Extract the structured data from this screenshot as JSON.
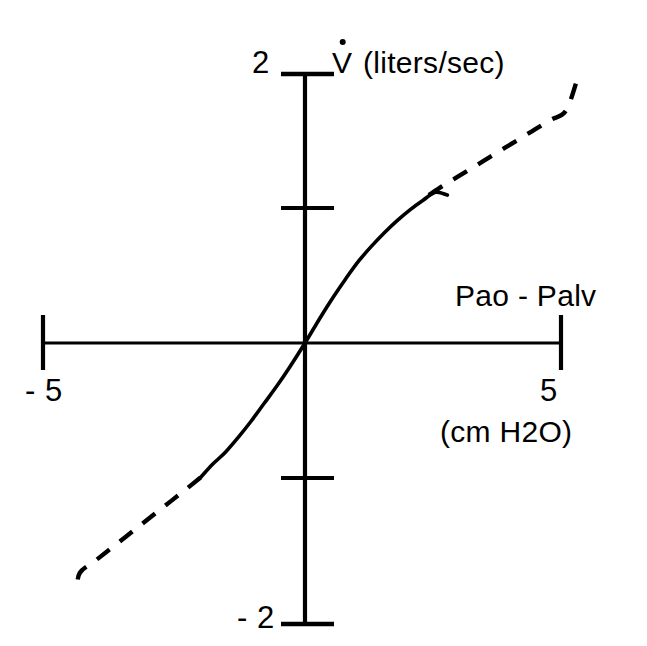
{
  "figure": {
    "background_color": "#ffffff",
    "ink_color": "#000000"
  },
  "axes": {
    "y_axis": {
      "title_symbol": "V",
      "title_units": " (liters/sec)",
      "tick_label_top": "2",
      "tick_label_bottom": "- 2"
    },
    "x_axis": {
      "title": "Pao - Palv",
      "units": "(cm H2O)",
      "tick_label_left": "- 5",
      "tick_label_right": "5"
    }
  },
  "chart_data": {
    "type": "line",
    "title": "",
    "subtitle": "",
    "xlabel": "Pao - Palv (cm H2O)",
    "ylabel": "V̇ (liters/sec)",
    "xlim": [
      -5,
      5
    ],
    "ylim": [
      -2,
      2
    ],
    "xticks": [
      -5,
      0,
      5
    ],
    "xtick_labels": [
      "- 5",
      "",
      "5"
    ],
    "yticks": [
      -2,
      -1,
      0,
      1,
      2
    ],
    "ytick_labels": [
      "- 2",
      "",
      "",
      "",
      "2"
    ],
    "grid": false,
    "legend": null,
    "annotations": [
      {
        "text": "Pao - Palv",
        "x": 3.0,
        "y": 0.46
      },
      {
        "text": "(cm H2O)",
        "x": 2.7,
        "y": -0.55
      },
      {
        "text": "V̇ (liters/sec)",
        "x": 0.55,
        "y": 2.1
      }
    ],
    "series": [
      {
        "name": "airway-flow-vs-pressure",
        "style": "solid",
        "comment": "measured range, drawn as a continuous line",
        "x": [
          -2.04,
          -1.8,
          -1.55,
          -1.3,
          -1.05,
          -0.8,
          -0.55,
          -0.3,
          0.0,
          0.3,
          0.55,
          0.8,
          1.05,
          1.3,
          1.55,
          1.8,
          2.05,
          2.3,
          2.55,
          2.78
        ],
        "y": [
          -1.0,
          -0.9,
          -0.81,
          -0.7,
          -0.58,
          -0.45,
          -0.32,
          -0.18,
          0.0,
          0.19,
          0.34,
          0.48,
          0.61,
          0.72,
          0.82,
          0.91,
          0.99,
          1.06,
          1.12,
          1.1
        ]
      },
      {
        "name": "airway-flow-vs-pressure-extrapolated-upper",
        "style": "dashed",
        "comment": "extrapolated upper-right branch",
        "x": [
          2.42,
          2.7,
          3.0,
          3.3,
          3.6,
          3.9,
          4.2,
          4.5,
          4.8,
          5.1,
          5.34
        ],
        "y": [
          1.1,
          1.17,
          1.24,
          1.31,
          1.38,
          1.45,
          1.52,
          1.59,
          1.66,
          1.73,
          1.99
        ]
      },
      {
        "name": "airway-flow-vs-pressure-extrapolated-lower",
        "style": "dashed",
        "comment": "extrapolated lower-left branch",
        "x": [
          -2.04,
          -2.3,
          -2.6,
          -2.9,
          -3.2,
          -3.5,
          -3.8,
          -4.1,
          -4.4,
          -4.45
        ],
        "y": [
          -1.0,
          -1.08,
          -1.17,
          -1.26,
          -1.35,
          -1.44,
          -1.53,
          -1.62,
          -1.71,
          -1.84
        ]
      }
    ]
  }
}
